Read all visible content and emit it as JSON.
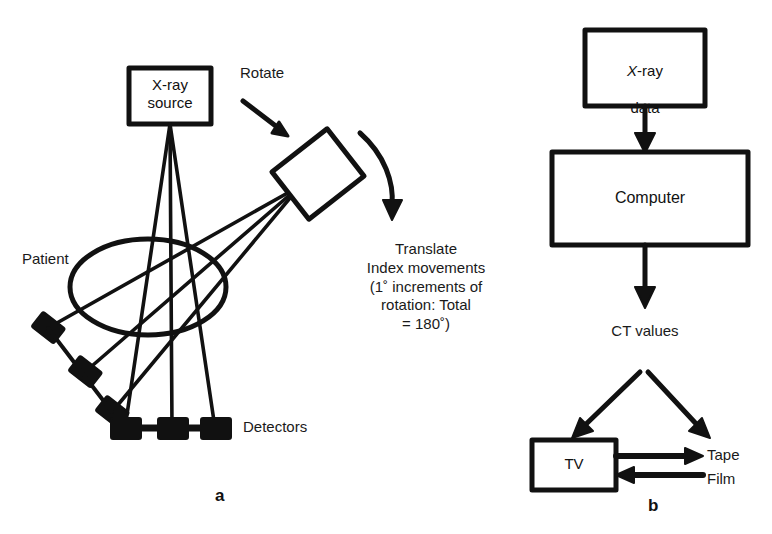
{
  "figure": {
    "panels": [
      {
        "letter": "a",
        "caption": "CT scanner translate-rotate geometry"
      },
      {
        "letter": "b",
        "caption": "CT data processing flow"
      }
    ]
  },
  "panel_a": {
    "letter": "a",
    "xray_source_box": {
      "line1": "X-ray",
      "line2": "source",
      "label": "X-ray\nsource"
    },
    "rotate_label": "Rotate",
    "patient_label": "Patient",
    "detectors_label": "Detectors",
    "translate_block": {
      "line1": "Translate",
      "line2": "Index movements",
      "line3": "(1˚ increments of",
      "line4": "rotation: Total",
      "line5": "= 180˚)",
      "full": "Translate\nIndex movements\n(1˚ increments of\nrotation: Total\n= 180˚)"
    },
    "detector_count_angled": "3",
    "detector_count_bottom": "3"
  },
  "panel_b": {
    "letter": "b",
    "xray_data_box": {
      "line1_italic": "X",
      "line1_rest": "-ray",
      "line2": "data",
      "label": "X-ray\ndata"
    },
    "computer_box": {
      "label": "Computer"
    },
    "ct_values_label": "CT values",
    "tv_box": {
      "label": "TV"
    },
    "tape_label": "Tape",
    "film_label": "Film"
  },
  "colors": {
    "ink": "#111111",
    "text": "#1a1a1a",
    "background": "#ffffff"
  }
}
